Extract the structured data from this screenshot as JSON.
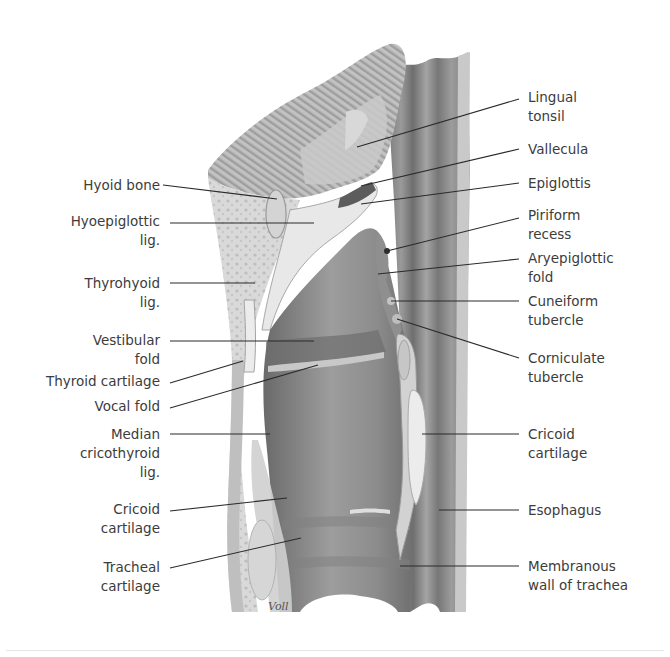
{
  "figure": {
    "signature": "Voll",
    "colors": {
      "background": "#ffffff",
      "tissue_light": "#dcdcdc",
      "tissue_mid": "#a9a9a9",
      "tissue_dark": "#6f6f6f",
      "lumen": "#8a8a8a",
      "cartilage": "#ececec",
      "leader_line": "#2a2a2a",
      "label_text": "#3c3c3c"
    }
  },
  "labels_left": [
    {
      "id": "hyoid-bone",
      "text": "Hyoid bone",
      "x": 78,
      "y": 176,
      "w": 82,
      "line": [
        163,
        185,
        277,
        199
      ]
    },
    {
      "id": "hyoepiglottic-lig",
      "text": "Hyoepiglottic\nlig.",
      "x": 64,
      "y": 212,
      "w": 96,
      "line": [
        170,
        223,
        314,
        223
      ]
    },
    {
      "id": "thyrohyoid-lig",
      "text": "Thyrohyoid\nlig.",
      "x": 64,
      "y": 274,
      "w": 96,
      "line": [
        170,
        283,
        255,
        283
      ]
    },
    {
      "id": "vestibular-fold",
      "text": "Vestibular\nfold",
      "x": 64,
      "y": 331,
      "w": 96,
      "line": [
        170,
        341,
        314,
        341
      ]
    },
    {
      "id": "thyroid-cartilage",
      "text": "Thyroid cartilage",
      "x": 30,
      "y": 372,
      "w": 130,
      "line": [
        170,
        383,
        243,
        361
      ]
    },
    {
      "id": "vocal-fold",
      "text": "Vocal fold",
      "x": 64,
      "y": 397,
      "w": 96,
      "line": [
        170,
        408,
        318,
        365
      ]
    },
    {
      "id": "median-cricothyroid-lig",
      "text": "Median\ncricothyroid\nlig.",
      "x": 64,
      "y": 425,
      "w": 96,
      "line": [
        170,
        434,
        270,
        434
      ]
    },
    {
      "id": "cricoid-cartilage-left",
      "text": "Cricoid\ncartilage",
      "x": 64,
      "y": 500,
      "w": 96,
      "line": [
        170,
        511,
        287,
        498
      ]
    },
    {
      "id": "tracheal-cartilage",
      "text": "Tracheal\ncartilage",
      "x": 64,
      "y": 558,
      "w": 96,
      "line": [
        170,
        568,
        301,
        538
      ]
    }
  ],
  "labels_right": [
    {
      "id": "lingual-tonsil",
      "text": "Lingual\ntonsil",
      "x": 528,
      "y": 88,
      "w": 120,
      "line": [
        519,
        99,
        357,
        147
      ]
    },
    {
      "id": "vallecula",
      "text": "Vallecula",
      "x": 528,
      "y": 140,
      "w": 120,
      "line": [
        519,
        149,
        361,
        186
      ]
    },
    {
      "id": "epiglottis",
      "text": "Epiglottis",
      "x": 528,
      "y": 174,
      "w": 120,
      "line": [
        519,
        183,
        361,
        204
      ]
    },
    {
      "id": "piriform-recess",
      "text": "Piriform\nrecess",
      "x": 528,
      "y": 206,
      "w": 120,
      "line": [
        519,
        218,
        387,
        251
      ]
    },
    {
      "id": "aryepiglottic-fold",
      "text": "Aryepiglottic\nfold",
      "x": 528,
      "y": 249,
      "w": 120,
      "line": [
        519,
        259,
        378,
        274
      ]
    },
    {
      "id": "cuneiform-tubercle",
      "text": "Cuneiform\ntubercle",
      "x": 528,
      "y": 292,
      "w": 120,
      "line": [
        519,
        301,
        391,
        301
      ]
    },
    {
      "id": "corniculate-tubercle",
      "text": "Corniculate\ntubercle",
      "x": 528,
      "y": 349,
      "w": 120,
      "line": [
        519,
        358,
        397,
        319
      ]
    },
    {
      "id": "cricoid-cartilage-right",
      "text": "Cricoid\ncartilage",
      "x": 528,
      "y": 425,
      "w": 120,
      "line": [
        519,
        434,
        422,
        434
      ]
    },
    {
      "id": "esophagus",
      "text": "Esophagus",
      "x": 528,
      "y": 501,
      "w": 120,
      "line": [
        519,
        510,
        439,
        510
      ]
    },
    {
      "id": "membranous-wall-of-trachea",
      "text": "Membranous\nwall of trachea",
      "x": 528,
      "y": 557,
      "w": 140,
      "line": [
        519,
        566,
        400,
        566
      ]
    }
  ]
}
